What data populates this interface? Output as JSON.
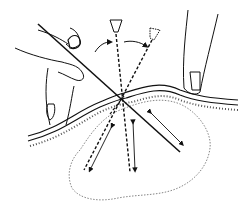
{
  "illustration": {
    "subject": "needle aspiration technique diagram",
    "colors": {
      "ink": "#111111",
      "background": "#ffffff",
      "stipple": "#444444"
    },
    "elements": {
      "left_hand": "hand holding syringe",
      "right_finger": "finger stabilizing skin",
      "skin_surface": "skin layers",
      "needle_solid": "needle inserted",
      "needle_dashed_vertical": "redirected needle vertical",
      "needle_dashed_angled": "redirected needle angled",
      "lesion": "mass outline",
      "arrows": "to-and-fro motion arrows"
    }
  }
}
